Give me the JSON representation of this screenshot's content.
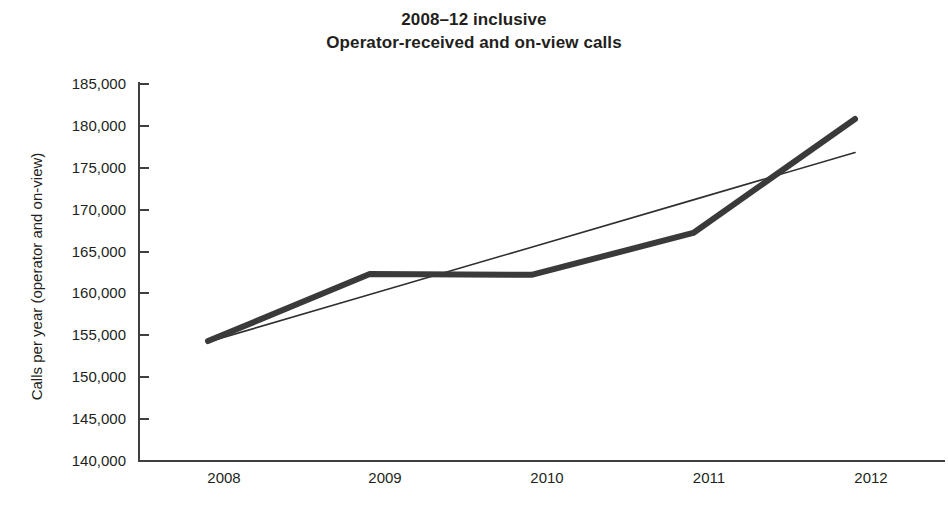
{
  "chart_data": {
    "type": "line",
    "title": "2008–12 inclusive\nOperator-received and on-view calls",
    "title_lines": [
      "2008–12 inclusive",
      "Operator-received and on-view calls"
    ],
    "xlabel": "",
    "ylabel": "Calls per year (operator and on-view)",
    "categories": [
      "2008",
      "2009",
      "2010",
      "2011",
      "2012"
    ],
    "x": [
      2008,
      2009,
      2010,
      2011,
      2012
    ],
    "xtick_labels": [
      "2008",
      "2009",
      "2010",
      "2011",
      "2012"
    ],
    "ytick_labels": [
      "185,000",
      "180,000",
      "175,000",
      "170,000",
      "165,000",
      "160,000",
      "155,000",
      "150,000",
      "145,000",
      "140,000"
    ],
    "ytick_values": [
      185000,
      180000,
      175000,
      170000,
      165000,
      160000,
      155000,
      150000,
      145000,
      140000
    ],
    "ylim": [
      140000,
      185000
    ],
    "ytick_step": 5000,
    "grid": false,
    "legend": null,
    "legend_position": "none",
    "series": [
      {
        "name": "Calls per year (operator and on-view)",
        "style": "thick-line",
        "color": "#3a3a3a",
        "line_width": 6,
        "values": [
          154200,
          162200,
          162100,
          167100,
          180700
        ]
      },
      {
        "name": "Linear trend",
        "style": "thin-line",
        "color": "#2f2f2f",
        "line_width": 1.6,
        "values": [
          154100,
          159750,
          165400,
          171050,
          176700
        ]
      }
    ],
    "annotations": [
      {
        "label": "trendline crossing",
        "x": 2011.5,
        "y": 173900
      }
    ]
  },
  "axes": {
    "y_axis_color": "#3f3f3f",
    "x_axis_color": "#3f3f3f"
  },
  "figure": {
    "background": "#ffffff",
    "text_color": "#231f20"
  }
}
